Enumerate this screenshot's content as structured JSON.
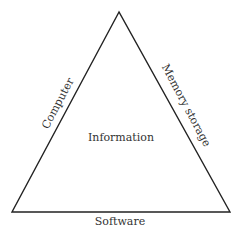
{
  "diagram": {
    "type": "triangle",
    "center_label": "Information",
    "edges": {
      "left": "Computer",
      "right": "Memory storage",
      "bottom": "Software"
    },
    "colors": {
      "stroke": "#222222",
      "text": "#333333",
      "background": "#ffffff"
    }
  }
}
